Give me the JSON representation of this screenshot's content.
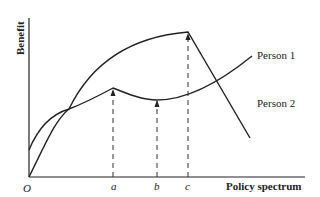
{
  "diagram": {
    "y_axis_label": "Benefit",
    "x_axis_label": "Policy spectrum",
    "origin_label": "O",
    "x_marks": [
      {
        "label": "a",
        "x": 113
      },
      {
        "label": "b",
        "x": 157
      },
      {
        "label": "c",
        "x": 188
      }
    ],
    "curves": [
      {
        "name": "Person 1",
        "label": "Person 1",
        "description": "starts at benefit level above origin, local peak at a, local minimum at b, rises to the right"
      },
      {
        "name": "Person 2",
        "label": "Person 2",
        "description": "starts at origin, rises to peak at c, then falls linearly"
      }
    ],
    "colors": {
      "line": "#222222",
      "background": "#ffffff"
    }
  }
}
